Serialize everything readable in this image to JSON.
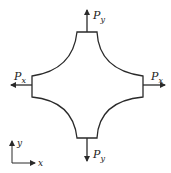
{
  "diagram": {
    "type": "biaxial-loaded-cruciform-specimen",
    "colors": {
      "stroke": "#2a2a2a",
      "background": "#ffffff"
    },
    "loads": {
      "top": {
        "label": "P",
        "subscript": "y"
      },
      "bottom": {
        "label": "P",
        "subscript": "y"
      },
      "left": {
        "label": "P",
        "subscript": "x"
      },
      "right": {
        "label": "P",
        "subscript": "x"
      }
    },
    "axes": {
      "y_label": "y",
      "x_label": "x"
    }
  }
}
